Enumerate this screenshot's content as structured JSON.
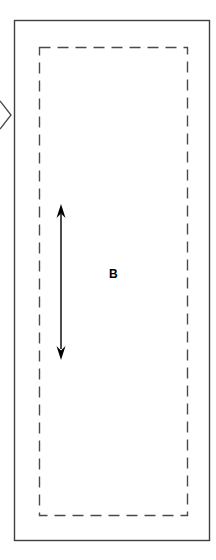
{
  "figure": {
    "region_label": "B",
    "colors": {
      "background": "#ffffff",
      "outline": "#3f3f3f",
      "dashed_boundary": "#4a4a4a",
      "arrow": "#000000",
      "label": "#000000"
    },
    "icons": {
      "vertical_double_arrow": "double-headed-vertical-arrow-icon",
      "left_edge_arrowhead": "right-pointing-chevron-icon"
    }
  }
}
